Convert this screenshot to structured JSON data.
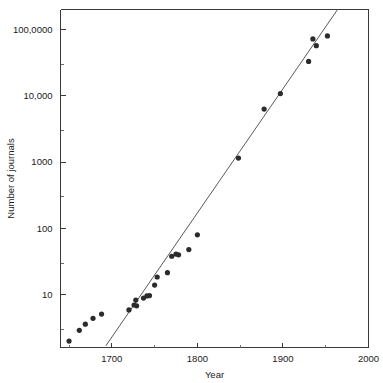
{
  "chart_data": {
    "type": "scatter",
    "title": "",
    "xlabel": "Year",
    "ylabel": "Number of journals",
    "xlim": [
      1640,
      2000
    ],
    "ylim": [
      1.6,
      200000
    ],
    "yscale": "log",
    "grid": false,
    "legend": null,
    "x_ticks": [
      {
        "value": 1700,
        "label": "1700"
      },
      {
        "value": 1800,
        "label": "1800"
      },
      {
        "value": 1900,
        "label": "1900"
      },
      {
        "value": 2000,
        "label": "2000"
      }
    ],
    "x_minor_ticks": [
      1650,
      1750,
      1850,
      1950
    ],
    "y_ticks": [
      {
        "value": 10,
        "label": "10"
      },
      {
        "value": 100,
        "label": "100"
      },
      {
        "value": 1000,
        "label": "1000"
      },
      {
        "value": 10000,
        "label": "10,000"
      },
      {
        "value": 100000,
        "label": "100,0000"
      }
    ],
    "y_minor_ticks": [
      3,
      30,
      300,
      3000,
      30000
    ],
    "points": [
      {
        "x": 1650,
        "y": 2.0
      },
      {
        "x": 1662,
        "y": 2.9
      },
      {
        "x": 1669,
        "y": 3.6
      },
      {
        "x": 1678,
        "y": 4.4
      },
      {
        "x": 1688,
        "y": 5.1
      },
      {
        "x": 1720,
        "y": 5.9
      },
      {
        "x": 1726,
        "y": 7.0
      },
      {
        "x": 1728,
        "y": 8.3
      },
      {
        "x": 1729,
        "y": 6.8
      },
      {
        "x": 1737,
        "y": 8.9
      },
      {
        "x": 1741,
        "y": 9.6
      },
      {
        "x": 1744,
        "y": 9.7
      },
      {
        "x": 1750,
        "y": 14.0
      },
      {
        "x": 1753,
        "y": 18.5
      },
      {
        "x": 1765,
        "y": 21.5
      },
      {
        "x": 1770,
        "y": 38.0
      },
      {
        "x": 1775,
        "y": 41.0
      },
      {
        "x": 1778,
        "y": 40.0
      },
      {
        "x": 1790,
        "y": 48.0
      },
      {
        "x": 1800,
        "y": 80.0
      },
      {
        "x": 1848,
        "y": 1150.0
      },
      {
        "x": 1878,
        "y": 6300.0
      },
      {
        "x": 1897,
        "y": 10800.0
      },
      {
        "x": 1930,
        "y": 33000.0
      },
      {
        "x": 1935,
        "y": 72000.0
      },
      {
        "x": 1939,
        "y": 57000.0
      },
      {
        "x": 1952,
        "y": 80000.0
      }
    ],
    "fit_line": {
      "label": "exponential fit",
      "x_start": 1693,
      "y_start": 1.7,
      "x_end": 1965,
      "y_end": 210000
    },
    "colors": {
      "marker": "#2b2b2b",
      "fit_line": "#5a5a5a",
      "axis": "#3a3a3a",
      "background": "#ffffff",
      "text": "#1a1a1a"
    }
  }
}
